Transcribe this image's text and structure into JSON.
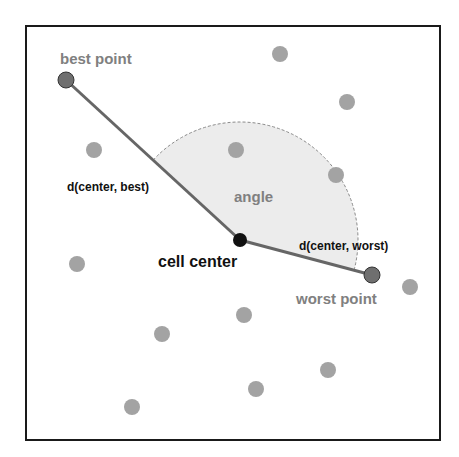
{
  "colors": {
    "frame": "#1a1a1a",
    "dot": "#a3a3a3",
    "special_dot": "#6f6f6f",
    "center_dot": "#111111",
    "line": "#666666",
    "wedge_fill": "#ececec",
    "wedge_stroke": "#8a8a8a",
    "gray_label": "#808080",
    "dark_label": "#111111"
  },
  "labels": {
    "best_point": "best point",
    "worst_point": "worst point",
    "cell_center": "cell center",
    "angle": "angle",
    "d_best": "d(center, best)",
    "d_worst": "d(center, worst)"
  },
  "points": {
    "center": [
      240,
      240
    ],
    "best": [
      66,
      80
    ],
    "worst": [
      372,
      275
    ],
    "others": [
      [
        280,
        54
      ],
      [
        347,
        102
      ],
      [
        94,
        150
      ],
      [
        236,
        150
      ],
      [
        336,
        175
      ],
      [
        77,
        264
      ],
      [
        410,
        287
      ],
      [
        244,
        315
      ],
      [
        162,
        334
      ],
      [
        328,
        370
      ],
      [
        256,
        389
      ],
      [
        132,
        407
      ]
    ]
  }
}
